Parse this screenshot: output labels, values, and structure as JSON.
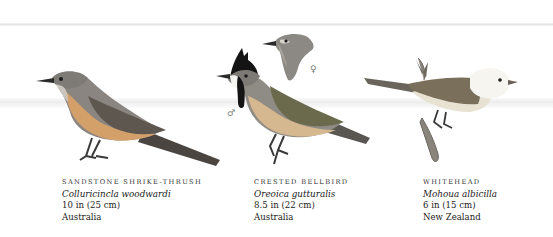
{
  "plate": {
    "colors": {
      "background": "#ffffff",
      "band": "#e8e8e8",
      "text": "#2a2a2a"
    },
    "birds": [
      {
        "common_name": "Sandstone Shrike-thrush",
        "latin_name": "Colluricincla woodwardi",
        "size": "10 in (25 cm)",
        "range": "Australia"
      },
      {
        "common_name": "Crested Bellbird",
        "latin_name": "Oreoica gutturalis",
        "size": "8.5 in (22 cm)",
        "range": "Australia",
        "male_symbol": "♂",
        "female_symbol": "♀"
      },
      {
        "common_name": "Whitehead",
        "latin_name": "Mohoua albicilla",
        "size": "6 in (15 cm)",
        "range": "New Zealand"
      }
    ]
  }
}
